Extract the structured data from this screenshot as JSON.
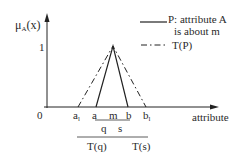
{
  "diagram": {
    "type": "fuzzy-membership-functions",
    "y_axis": {
      "label_base": "μ",
      "label_sub": "A",
      "label_arg": "(x)",
      "tick_1": "1",
      "origin": "0"
    },
    "x_axis": {
      "label": "attribute",
      "ticks": [
        {
          "base": "a",
          "sub": "l"
        },
        {
          "base": "a",
          "sub": ""
        },
        {
          "base": "m",
          "sub": ""
        },
        {
          "base": "b",
          "sub": ""
        },
        {
          "base": "b",
          "sub": "l"
        }
      ]
    },
    "intervals": {
      "q": "q",
      "s": "s",
      "Tq": "T(q)",
      "Ts": "T(s)"
    },
    "legend": {
      "solid_label_line1": "P: attribute A",
      "solid_label_line2": "is about m",
      "dashdot_label": "T(P)"
    },
    "series": [
      {
        "name": "P",
        "style": "solid",
        "points": [
          [
            "a",
            0
          ],
          [
            "m",
            1
          ],
          [
            "b",
            0
          ]
        ]
      },
      {
        "name": "T(P)",
        "style": "dash-dot",
        "points": [
          [
            "a_l",
            0
          ],
          [
            "m",
            1
          ],
          [
            "b_l",
            0
          ]
        ]
      }
    ],
    "colors": {
      "ink": "#222222",
      "background": "#ffffff"
    }
  }
}
